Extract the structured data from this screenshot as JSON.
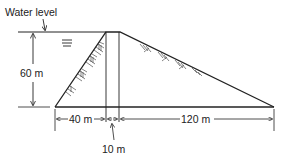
{
  "diagram": {
    "type": "dam-cross-section",
    "labels": {
      "water_level": "Water level",
      "height": "60 m",
      "upstream_base": "40 m",
      "crest_width": "10 m",
      "downstream_base": "120 m"
    },
    "dimensions": {
      "height_m": 60,
      "upstream_base_m": 40,
      "crest_width_m": 10,
      "downstream_base_m": 120
    },
    "colors": {
      "line": "#222222",
      "background": "#ffffff"
    }
  }
}
